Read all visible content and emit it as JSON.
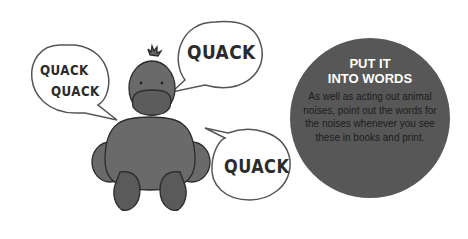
{
  "bubbles": [
    {
      "lines": [
        "QUACK",
        "QUACK"
      ]
    },
    {
      "lines": [
        "QUACK"
      ]
    },
    {
      "lines": [
        "QUACK"
      ]
    }
  ],
  "tip": {
    "title_line1": "PUT IT",
    "title_line2": "INTO WORDS",
    "body": "As well as acting out animal noises, point out the words for the noises whenever you see these in books and print."
  },
  "colors": {
    "circle": "#575757",
    "duck": "#6a6a6a",
    "outline": "#2b2b2b"
  }
}
